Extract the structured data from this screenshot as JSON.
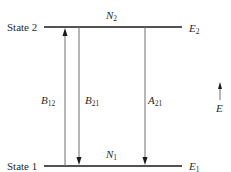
{
  "states": [
    {
      "id": "state2",
      "label": "State 2",
      "population": {
        "sym": "N",
        "sub": "2"
      },
      "energy": {
        "sym": "E",
        "sub": "2"
      }
    },
    {
      "id": "state1",
      "label": "State 1",
      "population": {
        "sym": "N",
        "sub": "1"
      },
      "energy": {
        "sym": "E",
        "sub": "1"
      }
    }
  ],
  "transitions": [
    {
      "id": "absorption",
      "sym": "B",
      "sub": "12",
      "direction": "up"
    },
    {
      "id": "stimulated-emission",
      "sym": "B",
      "sub": "21",
      "direction": "down"
    },
    {
      "id": "spontaneous-emission",
      "sym": "A",
      "sub": "21",
      "direction": "down"
    }
  ],
  "energy_axis": {
    "sym": "E",
    "direction": "up"
  },
  "colors": {
    "level_line": "#1a1a1a",
    "arrow": "#6e6e6e",
    "text": "#2a2a2a"
  }
}
